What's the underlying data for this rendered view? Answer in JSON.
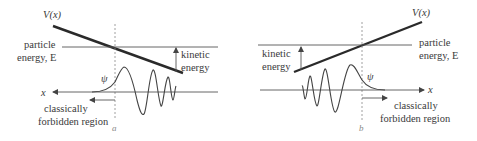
{
  "panels": [
    {
      "id": "left",
      "potential_label": "V(x)",
      "energy_label_line1": "particle",
      "energy_label_line2": "energy, E",
      "kinetic_label_line1": "kinetic",
      "kinetic_label_line2": "energy",
      "wavefunction_label": "ψ",
      "axis_label": "x",
      "forbidden_label_line1": "classically",
      "forbidden_label_line2": "forbidden region",
      "turning_point_label": "a"
    },
    {
      "id": "right",
      "potential_label": "V(x)",
      "energy_label_line1": "particle",
      "energy_label_line2": "energy, E",
      "kinetic_label_line1": "kinetic",
      "kinetic_label_line2": "energy",
      "wavefunction_label": "ψ",
      "axis_label": "x",
      "forbidden_label_line1": "classically",
      "forbidden_label_line2": "forbidden region",
      "turning_point_label": "b"
    }
  ],
  "colors": {
    "line": "#2a2a2a",
    "text": "#3a3a3a",
    "dashed": "#888888"
  }
}
